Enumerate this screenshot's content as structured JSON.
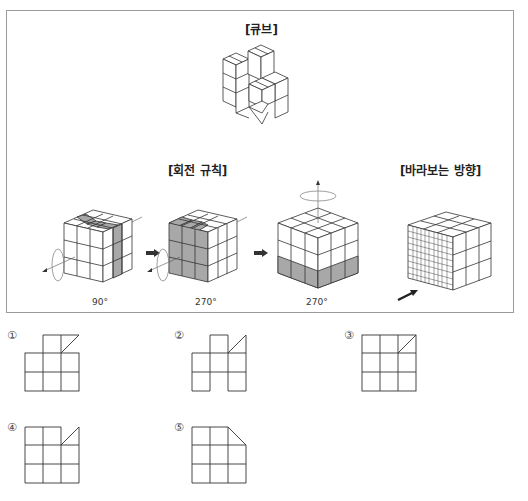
{
  "problem": {
    "cube_title": "[큐브]",
    "rotation_title": "[회전 규칙]",
    "view_title": "[바라보는 방향]",
    "rotations": [
      {
        "axis": "front-back (x)",
        "angle": "90°",
        "shaded": "right column of front face / top middle strip"
      },
      {
        "axis": "front-back (x)",
        "angle": "270°",
        "shaded": "front face left 2/3"
      },
      {
        "axis": "vertical (y)",
        "angle": "270°",
        "shaded": "bottom layer"
      }
    ],
    "view_direction": "front-left face (arrow)"
  },
  "options": [
    {
      "number": "①",
      "label": "option 1",
      "shape": "3x2 grid with middle-top cell and top-right triangle"
    },
    {
      "number": "②",
      "label": "option 2",
      "shape": "H-like grid with middle-top cell and top-right triangle"
    },
    {
      "number": "③",
      "label": "option 3",
      "shape": "3x3 grid with top-right cell diagonal"
    },
    {
      "number": "④",
      "label": "option 4",
      "shape": "3x3 grid with top-right triangle"
    },
    {
      "number": "⑤",
      "label": "option 5",
      "shape": "3x3 grid with top-right corner cut"
    }
  ],
  "colors": {
    "line": "#333333",
    "shade": "#a8a8a8",
    "frame": "#9a9a9a"
  }
}
